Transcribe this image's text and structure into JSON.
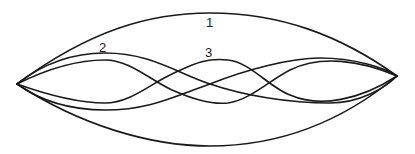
{
  "diagram": {
    "stroke_color": "#1a1a1a",
    "background": "#ffffff",
    "apex_left": [
      17,
      84
    ],
    "apex_right": [
      397,
      76
    ],
    "labels": [
      {
        "id": "1",
        "text": "1",
        "x": 206,
        "y": 27
      },
      {
        "id": "2",
        "text": "2",
        "x": 99,
        "y": 52
      },
      {
        "id": "3",
        "text": "3",
        "x": 205,
        "y": 57
      }
    ],
    "curves": [
      {
        "name": "curve-1-upper",
        "d": "M17,84 C90,30 150,13 210,13 C280,13 340,35 397,76"
      },
      {
        "name": "curve-1-lower",
        "d": "M17,84 C80,125 150,146 210,146 C290,146 350,115 397,76"
      },
      {
        "name": "curve-2-a",
        "d": "M17,84 C45,62 75,53 105,53 C150,53 175,72 210,84 C245,96 290,103 330,103 C360,103 385,88 397,76"
      },
      {
        "name": "curve-2-b",
        "d": "M17,84 C45,104 75,110 105,110 C150,110 175,96 210,84 C245,70 290,58 320,58 C355,58 385,68 397,76"
      },
      {
        "name": "curve-3-a",
        "d": "M17,84 C45,70 75,60 105,60 C130,60 150,80 172,90 C190,98 210,105 228,103 C250,100 270,80 290,70 C320,55 360,60 397,76"
      },
      {
        "name": "curve-3-b",
        "d": "M17,84 C45,94 75,103 105,103 C130,103 150,84 172,74 C190,66 205,57 228,60 C250,62 270,88 290,95 C320,108 360,100 397,76"
      }
    ]
  }
}
